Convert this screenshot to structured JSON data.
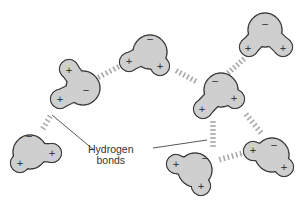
{
  "diagram": {
    "colors": {
      "molecule_fill": "#cfcfcf",
      "molecule_outline": "#3a3a3a",
      "bond_dash": "#a8a8a8",
      "label": "#333333"
    },
    "label": {
      "line1": "Hydrogen",
      "line2": "bonds"
    },
    "charge_symbols": {
      "positive": "+",
      "negative": "−"
    },
    "molecules": [
      {
        "id": "m1",
        "oxygen": [
          83,
          88
        ],
        "h1": [
          69,
          69
        ],
        "h2": [
          60,
          99
        ],
        "neg": [
          86,
          90
        ],
        "pos1": [
          69,
          70
        ],
        "pos2": [
          60,
          99
        ]
      },
      {
        "id": "m2",
        "oxygen": [
          150,
          52
        ],
        "h1": [
          129,
          62
        ],
        "h2": [
          160,
          66
        ],
        "neg": [
          150,
          39
        ],
        "pos1": [
          129,
          61
        ],
        "pos2": [
          160,
          66
        ]
      },
      {
        "id": "m3",
        "oxygen": [
          265,
          30
        ],
        "h1": [
          249,
          47
        ],
        "h2": [
          283,
          47
        ],
        "neg": [
          265,
          24
        ],
        "pos1": [
          248,
          48
        ],
        "pos2": [
          283,
          48
        ]
      },
      {
        "id": "m4",
        "oxygen": [
          221,
          90
        ],
        "h1": [
          203,
          109
        ],
        "h2": [
          235,
          99
        ],
        "neg": [
          215,
          81
        ],
        "pos1": [
          202,
          109
        ],
        "pos2": [
          234,
          98
        ]
      },
      {
        "id": "m5",
        "oxygen": [
          30,
          152
        ],
        "h1": [
          20,
          163
        ],
        "h2": [
          52,
          153
        ],
        "neg": [
          29,
          136
        ],
        "pos1": [
          20,
          163
        ],
        "pos2": [
          52,
          153
        ]
      },
      {
        "id": "m6",
        "oxygen": [
          195,
          170
        ],
        "h1": [
          176,
          164
        ],
        "h2": [
          201,
          186
        ],
        "neg": [
          205,
          158
        ],
        "pos1": [
          176,
          164
        ],
        "pos2": [
          201,
          186
        ]
      },
      {
        "id": "m7",
        "oxygen": [
          272,
          155
        ],
        "h1": [
          253,
          151
        ],
        "h2": [
          284,
          167
        ],
        "neg": [
          274,
          145
        ],
        "pos1": [
          253,
          150
        ],
        "pos2": [
          284,
          167
        ]
      }
    ],
    "hydrogen_bonds": [
      {
        "from": [
          97,
          78
        ],
        "to": [
          120,
          66
        ]
      },
      {
        "from": [
          175,
          70
        ],
        "to": [
          197,
          82
        ]
      },
      {
        "from": [
          227,
          74
        ],
        "to": [
          245,
          58
        ]
      },
      {
        "from": [
          42,
          130
        ],
        "to": [
          51,
          115
        ]
      },
      {
        "from": [
          213,
          120
        ],
        "to": [
          213,
          148
        ]
      },
      {
        "from": [
          218,
          160
        ],
        "to": [
          247,
          152
        ]
      },
      {
        "from": [
          245,
          113
        ],
        "to": [
          262,
          134
        ]
      }
    ],
    "leaders": [
      {
        "from": [
          52,
          115
        ],
        "to": [
          94,
          150
        ]
      },
      {
        "from": [
          153,
          148
        ],
        "to": [
          207,
          140
        ]
      }
    ],
    "label_position": {
      "left": 88,
      "top": 144
    }
  }
}
